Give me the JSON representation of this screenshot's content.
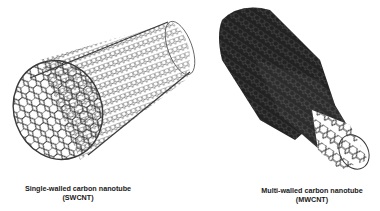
{
  "figure": {
    "panels": [
      {
        "id": "swcnt",
        "illustration": "single-walled-carbon-nanotube-icon",
        "caption_line1": "Single-walled carbon nanotube",
        "caption_line2": "(SWCNT)"
      },
      {
        "id": "mwcnt",
        "illustration": "multi-walled-carbon-nanotube-icon",
        "caption_line1": "Multi-walled carbon nanotube",
        "caption_line2": "(MWCNT)"
      }
    ],
    "colors": {
      "background": "#ffffff",
      "lattice": "#3a3a3a",
      "lattice_dark": "#1e1e1e",
      "caption": "#1a1a1a"
    }
  }
}
